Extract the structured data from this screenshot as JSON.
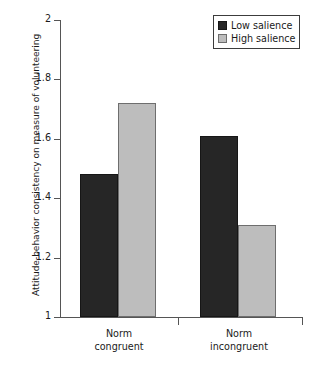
{
  "chart_data": {
    "type": "bar",
    "title": "",
    "subtitle": "",
    "xlabel": "",
    "ylabel": "Attitude-behavior consistency on measure of volunteering",
    "categories": [
      "Norm congruent",
      "Norm incongruent"
    ],
    "category_lines": [
      [
        "Norm",
        "congruent"
      ],
      [
        "Norm",
        "incongruent"
      ]
    ],
    "series": [
      {
        "name": "Low salience",
        "values": [
          1.48,
          1.61
        ],
        "color": "#262626"
      },
      {
        "name": "High salience",
        "values": [
          1.72,
          1.31
        ],
        "color": "#bdbdbd"
      }
    ],
    "ylim": [
      1,
      2
    ],
    "yticks": [
      1,
      1.2,
      1.4,
      1.6,
      1.8,
      2
    ],
    "ytick_labels": [
      "1",
      "1.2",
      "1.4",
      "1.6",
      "1.8",
      "2"
    ],
    "grid": false,
    "legend_position": "top-right"
  },
  "legend": {
    "entries": [
      {
        "label": "Low salience",
        "swatch": "dark-swatch-icon"
      },
      {
        "label": "High salience",
        "swatch": "light-swatch-icon"
      }
    ]
  },
  "axes": {
    "y_title": "Attitude-behavior consistency on measure of volunteering",
    "y_ticks": [
      "2",
      "1.8",
      "1.6",
      "1.4",
      "1.2",
      "1"
    ],
    "x_groups": [
      {
        "line1": "Norm",
        "line2": "congruent"
      },
      {
        "line1": "Norm",
        "line2": "incongruent"
      }
    ]
  },
  "colors": {
    "low_salience": "#262626",
    "high_salience": "#bdbdbd",
    "axis": "#555555",
    "text": "#1a1a1a",
    "background": "#ffffff"
  }
}
